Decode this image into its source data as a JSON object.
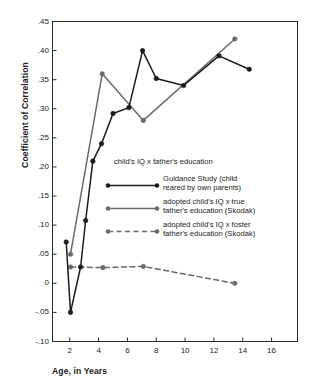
{
  "chart_data": {
    "type": "line",
    "title": "",
    "xlabel": "Age, in Years",
    "ylabel": "Coefficient of Correlation",
    "xlim": [
      0.8,
      17.8
    ],
    "ylim": [
      -0.1,
      0.45
    ],
    "xticks": [
      "2",
      "4",
      "6",
      "8",
      "10",
      "12",
      "14",
      "16"
    ],
    "xtick_values": [
      2,
      4,
      6,
      8,
      10,
      12,
      14,
      16
    ],
    "yticks": [
      ".45",
      ".40",
      ".35",
      ".30",
      ".25",
      ".20",
      ".15",
      ".10",
      ".05",
      "0",
      "-.05",
      "-.10"
    ],
    "ytick_values": [
      0.45,
      0.4,
      0.35,
      0.3,
      0.25,
      0.2,
      0.15,
      0.1,
      0.05,
      0.0,
      -0.05,
      -0.1
    ],
    "grid": false,
    "legend_position": "center",
    "legend_title": "child's IQ x father's education",
    "series": [
      {
        "name": "guidance-study",
        "label_lines": [
          "Guidance Study (child",
          "reared by own parents)"
        ],
        "style": "solid",
        "color": "#1b1b1b",
        "marker": "circle",
        "points": [
          {
            "x": 1.75,
            "y": 0.071
          },
          {
            "x": 2.05,
            "y": -0.05
          },
          {
            "x": 2.75,
            "y": 0.028
          },
          {
            "x": 3.1,
            "y": 0.108
          },
          {
            "x": 3.6,
            "y": 0.21
          },
          {
            "x": 4.2,
            "y": 0.24
          },
          {
            "x": 5.0,
            "y": 0.292
          },
          {
            "x": 6.1,
            "y": 0.302
          },
          {
            "x": 7.05,
            "y": 0.4
          },
          {
            "x": 8.0,
            "y": 0.352
          },
          {
            "x": 9.9,
            "y": 0.34
          },
          {
            "x": 12.35,
            "y": 0.391
          },
          {
            "x": 14.45,
            "y": 0.368
          }
        ]
      },
      {
        "name": "adopted-true-father",
        "label_lines": [
          "adopted child's IQ x true",
          "father's education (Skodak)"
        ],
        "style": "solid",
        "color": "#6a6a6a",
        "marker": "circle",
        "points": [
          {
            "x": 2.05,
            "y": 0.05
          },
          {
            "x": 4.25,
            "y": 0.36
          },
          {
            "x": 7.1,
            "y": 0.28
          },
          {
            "x": 13.45,
            "y": 0.42
          }
        ]
      },
      {
        "name": "adopted-foster-father",
        "label_lines": [
          "adopted child's IQ x foster",
          "father's education (Skodak)"
        ],
        "style": "dashed",
        "color": "#6a6a6a",
        "marker": "circle",
        "points": [
          {
            "x": 2.05,
            "y": 0.028
          },
          {
            "x": 4.3,
            "y": 0.027
          },
          {
            "x": 7.1,
            "y": 0.029
          },
          {
            "x": 13.45,
            "y": 0.0
          }
        ]
      }
    ]
  },
  "colors": {
    "frame": "#2a2a2a",
    "series_primary": "#1b1b1b",
    "series_secondary": "#6a6a6a",
    "background": "#ffffff"
  }
}
